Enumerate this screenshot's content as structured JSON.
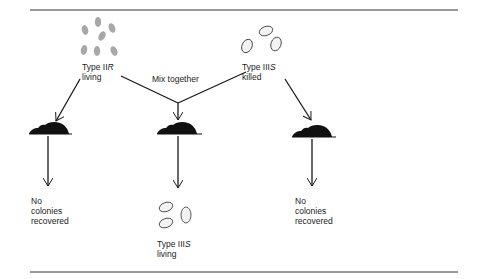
{
  "figure": {
    "type": "diagram",
    "colors": {
      "line": "#1a1a1a",
      "bacteria_living_fill": "#a8a8a8",
      "bacteria_killed_fill": "#f2f2f2",
      "mouse": "#111111"
    }
  },
  "inputs": {
    "left": {
      "type_prefix": "Type II",
      "type_suffix": "R",
      "state": "living"
    },
    "right": {
      "type_prefix": "Type III",
      "type_suffix": "S",
      "state": "killed"
    }
  },
  "mix_label": "Mix together",
  "outcomes": {
    "left": {
      "line1": "No",
      "line2": "colonies",
      "line3": "recovered"
    },
    "middle": {
      "type_prefix": "Type III",
      "type_suffix": "S",
      "state": "living"
    },
    "right": {
      "line1": "No",
      "line2": "colonies",
      "line3": "recovered"
    }
  }
}
